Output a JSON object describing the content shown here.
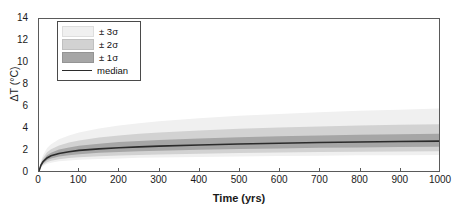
{
  "figure": {
    "background_color": "#ffffff",
    "frame_color": "#5a5a5a"
  },
  "axes": {
    "y": {
      "label": "ΔT (°C)",
      "ticks": [
        "0",
        "2",
        "4",
        "6",
        "8",
        "10",
        "12",
        "14"
      ],
      "min": 0,
      "max": 14
    },
    "x": {
      "label": "Time (yrs)",
      "ticks": [
        "0",
        "100",
        "200",
        "300",
        "400",
        "500",
        "600",
        "700",
        "800",
        "900",
        "1000"
      ],
      "min": 0,
      "max": 1000
    }
  },
  "legend": {
    "position": "upper-left-inside",
    "entries": [
      {
        "label": "± 3σ",
        "color": "#f0f0f0",
        "type": "band"
      },
      {
        "label": "± 2σ",
        "color": "#d2d2d2",
        "type": "band"
      },
      {
        "label": "± 1σ",
        "color": "#a6a6a6",
        "type": "band"
      },
      {
        "label": "median",
        "color": "#2b2b2b",
        "type": "line"
      }
    ]
  },
  "chart_data": {
    "type": "area",
    "title": "",
    "subtitle": "",
    "xlabel": "Time (yrs)",
    "ylabel": "ΔT (°C)",
    "xlim": [
      0,
      1000
    ],
    "ylim": [
      0,
      14
    ],
    "grid": false,
    "legend_position": "upper left",
    "x": [
      0,
      5,
      10,
      20,
      30,
      50,
      75,
      100,
      150,
      200,
      250,
      300,
      400,
      500,
      600,
      700,
      800,
      900,
      1000
    ],
    "series": [
      {
        "name": "median",
        "type": "line",
        "color": "#2b2b2b",
        "values": [
          0.0,
          0.55,
          0.85,
          1.2,
          1.4,
          1.62,
          1.78,
          1.9,
          2.04,
          2.14,
          2.22,
          2.29,
          2.4,
          2.49,
          2.56,
          2.62,
          2.67,
          2.71,
          2.75
        ]
      },
      {
        "name": "+1σ",
        "type": "bound",
        "color": "#a6a6a6",
        "values": [
          0.0,
          0.66,
          1.02,
          1.45,
          1.69,
          1.97,
          2.17,
          2.32,
          2.52,
          2.66,
          2.77,
          2.86,
          3.0,
          3.11,
          3.2,
          3.27,
          3.33,
          3.38,
          3.42
        ]
      },
      {
        "name": "-1σ",
        "type": "bound",
        "color": "#a6a6a6",
        "values": [
          0.0,
          0.45,
          0.7,
          0.99,
          1.15,
          1.33,
          1.46,
          1.55,
          1.67,
          1.75,
          1.81,
          1.87,
          1.95,
          2.02,
          2.08,
          2.13,
          2.17,
          2.21,
          2.24
        ]
      },
      {
        "name": "+2σ",
        "type": "bound",
        "color": "#d2d2d2",
        "values": [
          0.0,
          0.78,
          1.2,
          1.72,
          2.01,
          2.36,
          2.62,
          2.81,
          3.08,
          3.27,
          3.42,
          3.54,
          3.73,
          3.88,
          4.0,
          4.1,
          4.18,
          4.25,
          4.31
        ]
      },
      {
        "name": "-2σ",
        "type": "bound",
        "color": "#d2d2d2",
        "values": [
          0.0,
          0.37,
          0.58,
          0.81,
          0.95,
          1.09,
          1.19,
          1.27,
          1.37,
          1.43,
          1.48,
          1.53,
          1.6,
          1.65,
          1.7,
          1.74,
          1.77,
          1.8,
          1.83
        ]
      },
      {
        "name": "+3σ",
        "type": "bound",
        "color": "#f0f0f0",
        "values": [
          0.0,
          0.94,
          1.45,
          2.1,
          2.47,
          2.93,
          3.28,
          3.54,
          3.92,
          4.19,
          4.4,
          4.58,
          4.86,
          5.08,
          5.26,
          5.41,
          5.54,
          5.65,
          5.75
        ]
      },
      {
        "name": "-3σ",
        "type": "bound",
        "color": "#f0f0f0",
        "values": [
          0.0,
          0.3,
          0.47,
          0.66,
          0.77,
          0.89,
          0.97,
          1.03,
          1.11,
          1.16,
          1.21,
          1.24,
          1.3,
          1.34,
          1.38,
          1.41,
          1.44,
          1.46,
          1.48
        ]
      }
    ]
  }
}
